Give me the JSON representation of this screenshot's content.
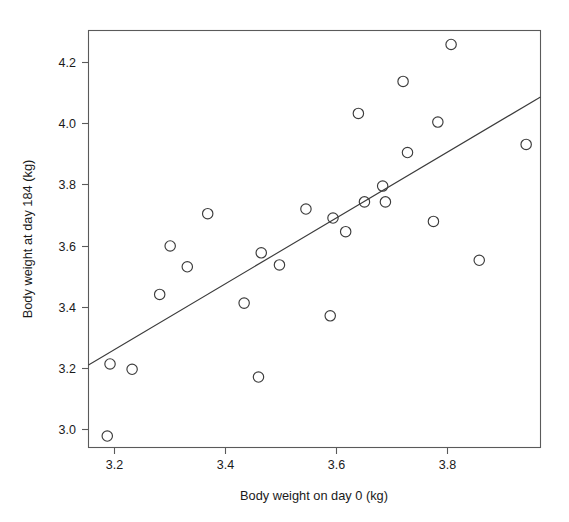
{
  "chart_data": {
    "type": "scatter",
    "title": "",
    "xlabel": "Body weight on day 0 (kg)",
    "ylabel": "Body weight at day 184 (kg)",
    "xlim": [
      3.148,
      3.967
    ],
    "ylim": [
      2.953,
      4.296
    ],
    "xticks": [
      3.2,
      3.4,
      3.6,
      3.8
    ],
    "xticklabels": [
      "3.2",
      "3.4",
      "3.6",
      "3.8"
    ],
    "yticks": [
      3.0,
      3.2,
      3.4,
      3.6,
      3.8,
      4.0,
      4.2
    ],
    "yticklabels": [
      "3.0",
      "3.2",
      "3.4",
      "3.6",
      "3.8",
      "4.0",
      "4.2"
    ],
    "grid": false,
    "legend": null,
    "marker": "open-circle",
    "marker_color": "#3c3c3c",
    "x": [
      3.182,
      3.187,
      3.227,
      3.277,
      3.296,
      3.327,
      3.364,
      3.43,
      3.456,
      3.461,
      3.494,
      3.542,
      3.586,
      3.591,
      3.614,
      3.637,
      3.648,
      3.681,
      3.686,
      3.718,
      3.726,
      3.773,
      3.781,
      3.805,
      3.856,
      3.941
    ],
    "y": [
      2.99,
      3.222,
      3.205,
      3.446,
      3.602,
      3.535,
      3.706,
      3.418,
      3.18,
      3.58,
      3.541,
      3.721,
      3.377,
      3.692,
      3.648,
      4.029,
      3.744,
      3.795,
      3.744,
      4.132,
      3.903,
      3.681,
      4.001,
      4.251,
      3.556,
      3.929
    ],
    "points": [
      {
        "x": 3.182,
        "y": 2.99
      },
      {
        "x": 3.187,
        "y": 3.222
      },
      {
        "x": 3.227,
        "y": 3.205
      },
      {
        "x": 3.277,
        "y": 3.446
      },
      {
        "x": 3.296,
        "y": 3.602
      },
      {
        "x": 3.327,
        "y": 3.535
      },
      {
        "x": 3.364,
        "y": 3.706
      },
      {
        "x": 3.43,
        "y": 3.418
      },
      {
        "x": 3.456,
        "y": 3.18
      },
      {
        "x": 3.461,
        "y": 3.58
      },
      {
        "x": 3.494,
        "y": 3.541
      },
      {
        "x": 3.542,
        "y": 3.721
      },
      {
        "x": 3.586,
        "y": 3.377
      },
      {
        "x": 3.591,
        "y": 3.692
      },
      {
        "x": 3.614,
        "y": 3.648
      },
      {
        "x": 3.637,
        "y": 4.029
      },
      {
        "x": 3.648,
        "y": 3.744
      },
      {
        "x": 3.681,
        "y": 3.795
      },
      {
        "x": 3.686,
        "y": 3.744
      },
      {
        "x": 3.718,
        "y": 4.132
      },
      {
        "x": 3.726,
        "y": 3.903
      },
      {
        "x": 3.773,
        "y": 3.681
      },
      {
        "x": 3.781,
        "y": 4.001
      },
      {
        "x": 3.805,
        "y": 4.251
      },
      {
        "x": 3.856,
        "y": 3.556
      },
      {
        "x": 3.941,
        "y": 3.929
      }
    ],
    "fit_line": {
      "type": "linear-regression",
      "x_start": 3.148,
      "y_start": 3.219,
      "x_end": 3.967,
      "y_end": 4.082,
      "slope": 1.054,
      "intercept": -0.098,
      "color": "#3c3c3c"
    },
    "spines": {
      "top": true,
      "right": true,
      "bottom": true,
      "left": true
    },
    "box_color": "#5a5a5a"
  }
}
